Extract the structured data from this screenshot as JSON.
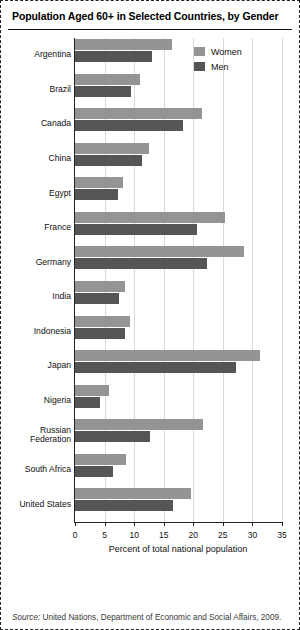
{
  "figure": {
    "title": "Population Aged 60+ in Selected Countries, by Gender",
    "source_prefix": "Source:",
    "source_text": " United Nations, Department of Economic and Social Affairs, 2009."
  },
  "legend": {
    "position": "top-right",
    "items": [
      {
        "label": "Women",
        "color": "#949494"
      },
      {
        "label": "Men",
        "color": "#555555"
      }
    ]
  },
  "chart_data": {
    "type": "bar",
    "orientation": "horizontal",
    "title": "Population Aged 60+ in Selected Countries, by Gender",
    "xlabel": "Percent of total national population",
    "ylabel": "",
    "xlim": [
      0,
      35
    ],
    "xticks": [
      0,
      5,
      10,
      15,
      20,
      25,
      30,
      35
    ],
    "xtick_labels": [
      "0",
      "5",
      "10",
      "15",
      "20",
      "25",
      "30",
      "35"
    ],
    "grid": true,
    "grid_axis": "x",
    "categories": [
      "Argentina",
      "Brazil",
      "Canada",
      "China",
      "Egypt",
      "France",
      "Germany",
      "India",
      "Indonesia",
      "Japan",
      "Nigeria",
      "Russian Federation",
      "South Africa",
      "United States"
    ],
    "series": [
      {
        "name": "Women",
        "color": "#949494",
        "values": [
          16.4,
          11.0,
          21.5,
          12.5,
          8.2,
          25.3,
          28.5,
          8.4,
          9.3,
          31.2,
          5.7,
          21.7,
          8.6,
          19.6
        ]
      },
      {
        "name": "Men",
        "color": "#555555",
        "values": [
          13.0,
          9.4,
          18.3,
          11.3,
          7.2,
          20.7,
          22.4,
          7.5,
          8.4,
          27.3,
          4.3,
          12.6,
          6.5,
          16.6
        ]
      }
    ]
  }
}
